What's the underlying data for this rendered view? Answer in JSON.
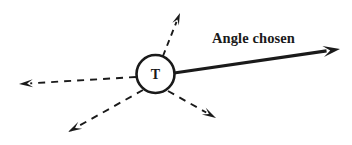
{
  "figure": {
    "type": "vector-diagram",
    "background_color": "#ffffff",
    "stroke_color": "#1a1a1a",
    "width": 352,
    "height": 145
  },
  "node": {
    "label": "T",
    "name": "node-t",
    "center_x": 155.5,
    "center_y": 74,
    "radius": 19,
    "stroke_width": 2.6,
    "fill": "#ffffff"
  },
  "annotation": {
    "label": "Angle chosen",
    "x": 212,
    "y": 43
  },
  "chosen_vector": {
    "name": "chosen-angle-arrow",
    "style": "solid",
    "stroke_width": 3.2,
    "from_x": 174,
    "from_y": 73,
    "to_x": 340,
    "to_y": 49,
    "head_length": 17,
    "head_width": 11
  },
  "candidate_vectors": [
    {
      "name": "candidate-arrow-up-right",
      "style": "dashed",
      "stroke_width": 1.9,
      "dash": "6 5",
      "from_x": 163,
      "from_y": 56,
      "to_x": 180,
      "to_y": 13,
      "head_length": 12,
      "head_width": 7
    },
    {
      "name": "candidate-arrow-left",
      "style": "dashed",
      "stroke_width": 1.9,
      "dash": "7 6",
      "from_x": 136,
      "from_y": 77,
      "to_x": 19,
      "to_y": 84,
      "head_length": 14,
      "head_width": 8
    },
    {
      "name": "candidate-arrow-down-left",
      "style": "dashed",
      "stroke_width": 1.9,
      "dash": "7 6",
      "from_x": 143,
      "from_y": 90,
      "to_x": 68,
      "to_y": 132,
      "head_length": 14,
      "head_width": 8
    },
    {
      "name": "candidate-arrow-down-right",
      "style": "dashed",
      "stroke_width": 1.9,
      "dash": "7 6",
      "from_x": 168,
      "from_y": 91,
      "to_x": 216,
      "to_y": 118,
      "head_length": 14,
      "head_width": 8
    }
  ]
}
